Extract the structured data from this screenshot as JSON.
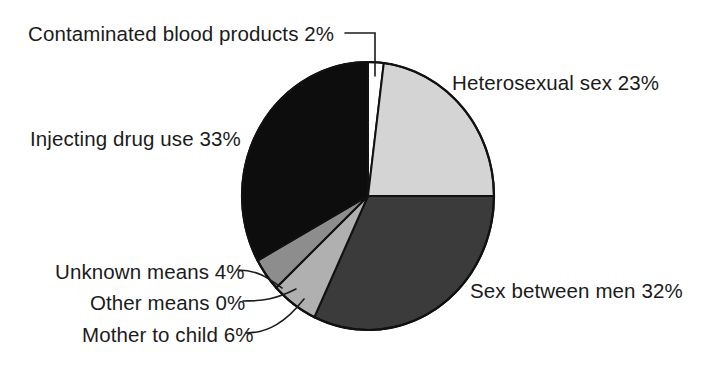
{
  "chart_data": {
    "type": "pie",
    "title": "",
    "subtitle": "",
    "xlabel": "",
    "ylabel": "",
    "legend_position": "none",
    "grid": false,
    "labels_show_percent": true,
    "categories": [
      "Contaminated blood products",
      "Heterosexual sex",
      "Sex between men",
      "Mother to child",
      "Other means",
      "Unknown means",
      "Injecting drug use"
    ],
    "values": [
      2,
      23,
      32,
      6,
      0,
      4,
      33
    ],
    "slice_colors": [
      "#ffffff",
      "#d4d4d4",
      "#3b3b3b",
      "#b0b0b0",
      "#ffffff",
      "#8d8d8d",
      "#0d0d0d"
    ],
    "annotations": [
      "Contaminated blood products 2%",
      "Heterosexual sex 23%",
      "Injecting drug use 33%",
      "Sex between men 32%",
      "Unknown means 4%",
      "Other means 0%",
      "Mother to child 6%"
    ]
  },
  "labels": {
    "contaminated": "Contaminated blood products 2%",
    "heterosexual": "Heterosexual sex 23%",
    "injecting": "Injecting drug use 33%",
    "sex_between_men": "Sex between men 32%",
    "unknown": "Unknown means 4%",
    "other": "Other means 0%",
    "mother_to_child": "Mother to child 6%"
  },
  "colors": {
    "outline": "#111111",
    "leader_line": "#1b1b1b",
    "background": "#ffffff",
    "text": "#1b1b1b"
  }
}
